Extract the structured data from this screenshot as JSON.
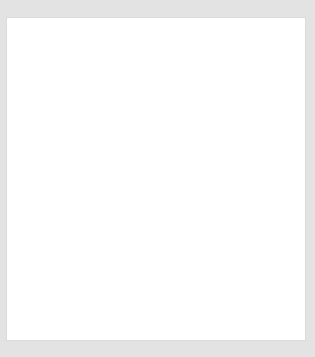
{
  "page": {
    "clipped_header_text": "........",
    "background_color": "#e3e3e3",
    "card_background": "#ffffff"
  },
  "card": {
    "title": "Scatterplot"
  },
  "chart_data": [
    {
      "id": "scatterplot",
      "type": "scatter",
      "title": "Scatterplot",
      "xlabel": "Miles driven",
      "ylabel": "Price (in dollars)",
      "xlim": [
        -8000,
        163000
      ],
      "ylim": [
        7500,
        46500
      ],
      "xticks": [
        0,
        50000,
        100000,
        150000
      ],
      "xticklabels": [
        "0",
        "50000",
        "100000",
        "150000"
      ],
      "yticks": [
        10000,
        15000,
        20000,
        25000,
        30000,
        35000,
        40000,
        45000
      ],
      "yticklabels": [
        "10000",
        "15000",
        "20000",
        "25000",
        "30000",
        "35000",
        "40000",
        "45000"
      ],
      "grid": false,
      "legend": "none",
      "points": [
        {
          "x": 2000,
          "y": 39800
        },
        {
          "x": 9000,
          "y": 31500
        },
        {
          "x": 26000,
          "y": 41800
        },
        {
          "x": 31000,
          "y": 41800
        },
        {
          "x": 30000,
          "y": 36100
        },
        {
          "x": 28000,
          "y": 30800
        },
        {
          "x": 28500,
          "y": 27500
        },
        {
          "x": 42000,
          "y": 23500
        },
        {
          "x": 63000,
          "y": 33200
        },
        {
          "x": 66000,
          "y": 23300
        },
        {
          "x": 58000,
          "y": 30500
        },
        {
          "x": 71000,
          "y": 29500
        },
        {
          "x": 129000,
          "y": 20900
        },
        {
          "x": 134000,
          "y": 14500
        },
        {
          "x": 143000,
          "y": 25200
        },
        {
          "x": 146000,
          "y": 21000
        }
      ],
      "trendline": {
        "x_start": 0,
        "y_start": 40200,
        "x_end": 158000,
        "y_end": 12200
      }
    },
    {
      "id": "residual-plot",
      "type": "scatter",
      "title": "",
      "xlabel": "Miles driven",
      "ylabel": "Residual",
      "xlim": [
        -8000,
        163000
      ],
      "ylim": [
        -8200,
        11500
      ],
      "xticks": [
        0,
        50000,
        100000,
        150000
      ],
      "xticklabels": [
        "0",
        "50000",
        "100000",
        "150000"
      ],
      "yticks": [
        -5000,
        0,
        5000,
        10000
      ],
      "yticklabels": [
        "-5000",
        "0",
        "5000",
        "10000"
      ],
      "grid": false,
      "legend": "none",
      "zero_reference_line": 0,
      "points": [
        {
          "x": 2000,
          "y": 400
        },
        {
          "x": 9000,
          "y": -4100
        },
        {
          "x": 26000,
          "y": 6300
        },
        {
          "x": 31000,
          "y": 7000
        },
        {
          "x": 30000,
          "y": 1700
        },
        {
          "x": 28000,
          "y": -3000
        },
        {
          "x": 28500,
          "y": -4600
        },
        {
          "x": 42000,
          "y": -6500
        },
        {
          "x": 58000,
          "y": 600
        },
        {
          "x": 63000,
          "y": 5200
        },
        {
          "x": 71000,
          "y": 2800
        },
        {
          "x": 66000,
          "y": -3800
        },
        {
          "x": 129000,
          "y": -2700
        },
        {
          "x": 134000,
          "y": -6000
        },
        {
          "x": 143000,
          "y": 4200
        },
        {
          "x": 146000,
          "y": 1600
        }
      ]
    }
  ]
}
